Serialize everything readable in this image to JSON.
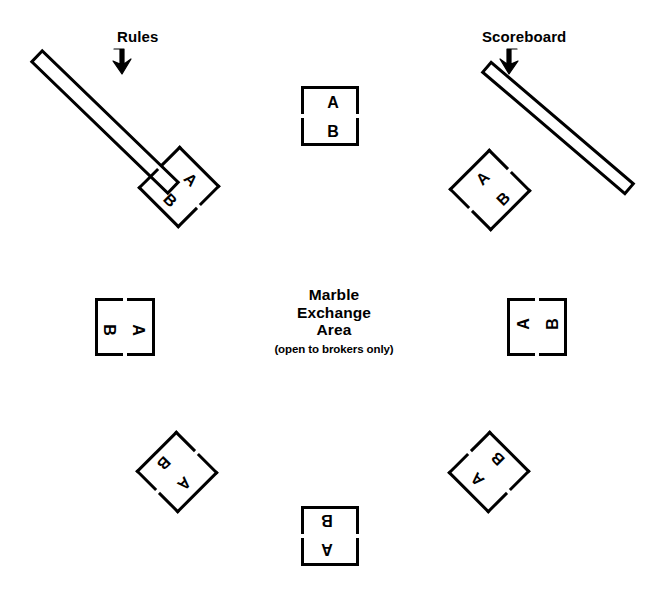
{
  "diagram": {
    "background_color": "#ffffff",
    "ink_color": "#000000",
    "width": 668,
    "height": 602
  },
  "center": {
    "line1": "Marble",
    "line2": "Exchange",
    "line3": "Area",
    "note": "(open to brokers only)"
  },
  "fixtures": [
    {
      "id": "rules",
      "label": "Rules",
      "shape": "angled-bar",
      "arrow": "down-right-arrow-icon",
      "rotation_deg": 45,
      "label_x": 117,
      "label_y": 28
    },
    {
      "id": "scoreboard",
      "label": "Scoreboard",
      "shape": "angled-bar",
      "arrow": "down-left-arrow-icon",
      "rotation_deg": -40,
      "label_x": 482,
      "label_y": 28
    }
  ],
  "tables": [
    {
      "id": "table-top-center",
      "position": "top-center",
      "rotation_deg": 0,
      "seat_near_label": "A",
      "seat_far_label": "B",
      "x": 301,
      "y": 86
    },
    {
      "id": "table-top-left",
      "position": "top-left",
      "rotation_deg": 45,
      "seat_near_label": "A",
      "seat_far_label": "B",
      "x": 150,
      "y": 157
    },
    {
      "id": "table-top-right",
      "position": "top-right",
      "rotation_deg": -45,
      "seat_near_label": "A",
      "seat_far_label": "B",
      "x": 461,
      "y": 160
    },
    {
      "id": "table-left-center",
      "position": "left-center",
      "rotation_deg": 90,
      "seat_near_label": "A",
      "seat_far_label": "B",
      "x": 96,
      "y": 297
    },
    {
      "id": "table-right-center",
      "position": "right-center",
      "rotation_deg": -90,
      "seat_near_label": "A",
      "seat_far_label": "B",
      "x": 508,
      "y": 297
    },
    {
      "id": "table-bottom-left",
      "position": "bottom-left",
      "rotation_deg": 135,
      "seat_near_label": "A",
      "seat_far_label": "B",
      "x": 148,
      "y": 442
    },
    {
      "id": "table-bottom-right",
      "position": "bottom-right",
      "rotation_deg": -135,
      "seat_near_label": "A",
      "seat_far_label": "B",
      "x": 460,
      "y": 442
    },
    {
      "id": "table-bottom-center",
      "position": "bottom-center",
      "rotation_deg": 180,
      "seat_near_label": "A",
      "seat_far_label": "B",
      "x": 301,
      "y": 506
    }
  ]
}
